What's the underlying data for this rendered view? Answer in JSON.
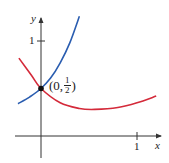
{
  "chart_data": {
    "type": "line",
    "title": "",
    "xlabel": "x",
    "ylabel": "y",
    "xlim": [
      -0.27,
      1.26
    ],
    "ylim": [
      -0.23,
      1.25
    ],
    "x_ticks": [
      {
        "value": 1,
        "label": "1"
      }
    ],
    "y_ticks": [
      {
        "value": 1,
        "label": "1"
      }
    ],
    "grid": false,
    "legend": null,
    "series": [
      {
        "name": "blue curve (increasing)",
        "color": "#2a5db0",
        "x": [
          -0.24,
          -0.12,
          0,
          0.1,
          0.2,
          0.3,
          0.4
        ],
        "y": [
          0.34,
          0.41,
          0.5,
          0.61,
          0.77,
          0.98,
          1.26
        ]
      },
      {
        "name": "red curve (decreasing then increasing)",
        "color": "#d42a3a",
        "x": [
          -0.23,
          -0.1,
          0,
          0.2,
          0.4,
          0.56,
          0.8,
          1.0,
          1.2
        ],
        "y": [
          0.82,
          0.64,
          0.5,
          0.35,
          0.29,
          0.28,
          0.3,
          0.35,
          0.42
        ]
      }
    ],
    "annotations": [
      {
        "type": "point",
        "x": 0,
        "y": 0.5,
        "label_main": "(0,",
        "label_num": "1",
        "label_den": "2",
        "label_close": ")"
      }
    ]
  },
  "axes": {
    "x_label": "x",
    "y_label": "y",
    "x_tick_label": "1",
    "y_tick_label": "1"
  },
  "colors": {
    "axis": "#333333",
    "blue": "#2a5db0",
    "red": "#d42a3a",
    "point": "#111111"
  }
}
